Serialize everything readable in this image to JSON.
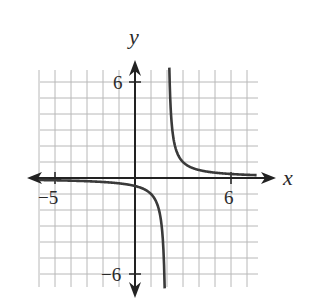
{
  "chart_data": {
    "type": "line",
    "title": "",
    "function": "y = 1/(x - 2)",
    "xlabel": "x",
    "ylabel": "y",
    "xlim": [
      -6,
      7
    ],
    "ylim": [
      -6.5,
      6.5
    ],
    "grid": true,
    "grid_step": 1,
    "tick_labels": {
      "x": [
        {
          "value": -5,
          "label": "−5"
        },
        {
          "value": 6,
          "label": "6"
        }
      ],
      "y": [
        {
          "value": 6,
          "label": "6"
        },
        {
          "value": -6,
          "label": "−6"
        }
      ]
    },
    "asymptotes": {
      "vertical": 2,
      "horizontal": 0
    },
    "series": [
      {
        "name": "left branch",
        "x": [
          -6,
          -5,
          -4,
          -3,
          -2,
          -1,
          0,
          1,
          1.5,
          1.8,
          1.85
        ],
        "y": [
          -0.125,
          -0.143,
          -0.167,
          -0.2,
          -0.25,
          -0.333,
          -0.5,
          -1,
          -2,
          -5,
          -6.5
        ]
      },
      {
        "name": "right branch",
        "x": [
          2.15,
          2.2,
          2.5,
          3,
          4,
          5,
          6,
          7.5
        ],
        "y": [
          6.5,
          5,
          2,
          1,
          0.5,
          0.333,
          0.25,
          0.18
        ]
      }
    ],
    "colors": {
      "curve": "#3a3a3a",
      "axis": "#222222",
      "grid": "#b5b5b5"
    }
  },
  "labels": {
    "x_axis": "x",
    "y_axis": "y",
    "x_neg5": "−5",
    "x_6": "6",
    "y_6": "6",
    "y_neg6": "−6"
  }
}
